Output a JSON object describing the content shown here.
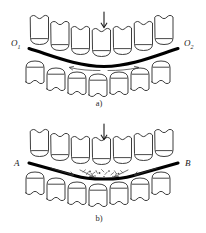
{
  "figure": {
    "background_color": "#ffffff",
    "ink_color": "#1b1b1b",
    "curve_color": "#000000",
    "debris_color": "#4a4a4a"
  },
  "panels": [
    {
      "id": "a",
      "caption": "a)",
      "left_label": "O",
      "left_label_sub": "1",
      "right_label": "O",
      "right_label_sub": "2",
      "load_arrow": "down-arrow",
      "curve_type": "smooth-concave",
      "upper_tooth_count": 7,
      "lower_tooth_count": 7,
      "flow_arrows": 2,
      "debris_present": false
    },
    {
      "id": "b",
      "caption": "b)",
      "left_label": "A",
      "left_label_sub": "",
      "right_label": "B",
      "right_label_sub": "",
      "load_arrow": "down-arrow",
      "curve_type": "kinked-concave",
      "upper_tooth_count": 7,
      "lower_tooth_count": 7,
      "flow_arrows": 4,
      "debris_present": true,
      "debris_count": 14
    }
  ]
}
